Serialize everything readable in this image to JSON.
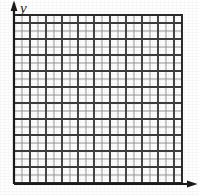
{
  "figure": {
    "background_color": "#fefefe"
  },
  "axes": {
    "y_axis": {
      "label": "y",
      "label_style": "italic",
      "has_arrowhead": true,
      "arrow_direction": "up",
      "color": "#1a1a1a",
      "x_position": 14,
      "top": 3,
      "bottom": 184
    },
    "x_axis": {
      "label": "",
      "has_arrowhead": true,
      "arrow_direction": "right",
      "color": "#1a1a1a",
      "y_position": 184,
      "left": 14,
      "right": 196
    }
  },
  "chart_data": {
    "type": "grid",
    "title": "",
    "xlabel": "",
    "ylabel": "y",
    "grid": true,
    "columns": 21,
    "rows": 21,
    "cell_size_px": 8,
    "major_every": 2,
    "origin": {
      "x": 14,
      "y": 183
    },
    "extent": {
      "left": 14,
      "top": 15,
      "right": 182,
      "bottom": 183
    },
    "series": [],
    "values": [],
    "categories": []
  },
  "style": {
    "minor_line_color": "#8a8a8a",
    "major_line_color": "#3d3d3d",
    "border_color": "#2b2b2b",
    "axis_color": "#1a1a1a",
    "cell_fill": "#fdfdfd",
    "minor_line_width": 0.9,
    "major_line_width": 1.9,
    "border_width": 2.0,
    "axis_width": 2.2
  }
}
